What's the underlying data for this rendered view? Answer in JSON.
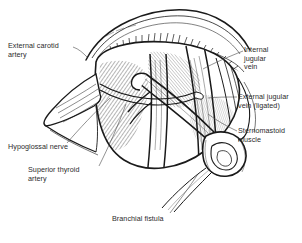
{
  "figure": {
    "medium": "pen-and-ink line drawing",
    "background_color": "#ffffff",
    "ink_color": "#1a1a1a",
    "text_color": "#2b2b2b"
  },
  "labels": {
    "external_carotid_artery": "External carotid\nartery",
    "internal_jugular_vein": "Internal\njugular\nvein",
    "external_jugular_vein_ligated": "External jugular\nvein (ligated)",
    "sternomastoid_muscle": "Sternomastoid\nmuscle",
    "hypoglossal_nerve": "Hypoglossal nerve",
    "superior_thyroid_artery": "Superior thyroid\nartery",
    "branchial_fistula": "Branchial fistula"
  }
}
